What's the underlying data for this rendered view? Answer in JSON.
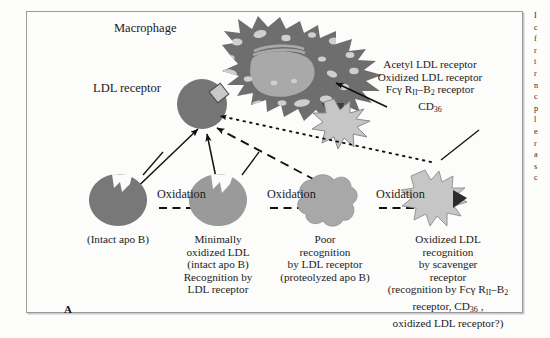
{
  "figure": {
    "panel_label": "A",
    "macrophage_label": "Macrophage",
    "ldl_receptor_label": "LDL receptor",
    "receptor_list": [
      "Acetyl LDL receptor",
      "Oxidized LDL receptor",
      "Fcγ R₁₁–B₂ receptor",
      "CD₃₆"
    ],
    "receptor_list_lines": {
      "line1": "Acetyl LDL receptor",
      "line2": "Oxidized LDL receptor",
      "line3_pre": "Fcγ R",
      "line3_sub1": "II",
      "line3_mid": "–B",
      "line3_sub2": "2",
      "line3_post": " receptor",
      "line4_pre": "CD",
      "line4_sub": "36"
    },
    "arrow_labels": [
      "Oxidation",
      "Oxidation",
      "Oxidation"
    ],
    "particles": [
      {
        "name": "intact-ldl",
        "caption_lines": [
          "(Intact apo B)"
        ],
        "fill": "#787878"
      },
      {
        "name": "minimally-oxidized-ldl",
        "caption_lines": [
          "Minimally",
          "oxidized LDL",
          "(intact apo B)",
          "Recognition by",
          "LDL receptor"
        ],
        "fill": "#9a9a9a"
      },
      {
        "name": "poorly-recognized-ldl",
        "caption_lines": [
          "Poor",
          "recognition",
          "by LDL receptor",
          "(proteolyzed apo B)"
        ],
        "fill": "#a8a8a8"
      },
      {
        "name": "oxidized-ldl",
        "caption_lines": [
          "Oxidized LDL",
          "recognition",
          "by scavenger",
          "receptor"
        ],
        "caption_paren_lines": {
          "l1_pre": "(recognition by Fcγ R",
          "l1_sub1": "II",
          "l1_mid": "–B",
          "l1_sub2": "2",
          "l2_pre": "receptor, CD",
          "l2_sub": "36",
          "l2_post": " ,",
          "l3": "oxidized LDL receptor?)"
        },
        "fill": "#c2c2c2"
      }
    ],
    "colors": {
      "macrophage_body": "#6e6e6e",
      "macrophage_nucleus": "#a9a9a9",
      "macrophage_vacuole": "#cfcfcf",
      "ldl_receptor_circle": "#757575",
      "receptor_diamond": "#c8c8c8",
      "scavenger_star": "#c6c6c6",
      "dark_wedge": "#2b2b2b",
      "frame_border": "#9a9a9a",
      "page_background": "#ffffff",
      "text": "#1b1b1b"
    },
    "side_column_sliver": [
      "I",
      "c",
      "f",
      "r",
      "t",
      "r",
      "n",
      "c",
      "p",
      "l",
      "e",
      "r",
      "a",
      "s",
      "c",
      "s",
      "t",
      "r",
      "r"
    ]
  }
}
